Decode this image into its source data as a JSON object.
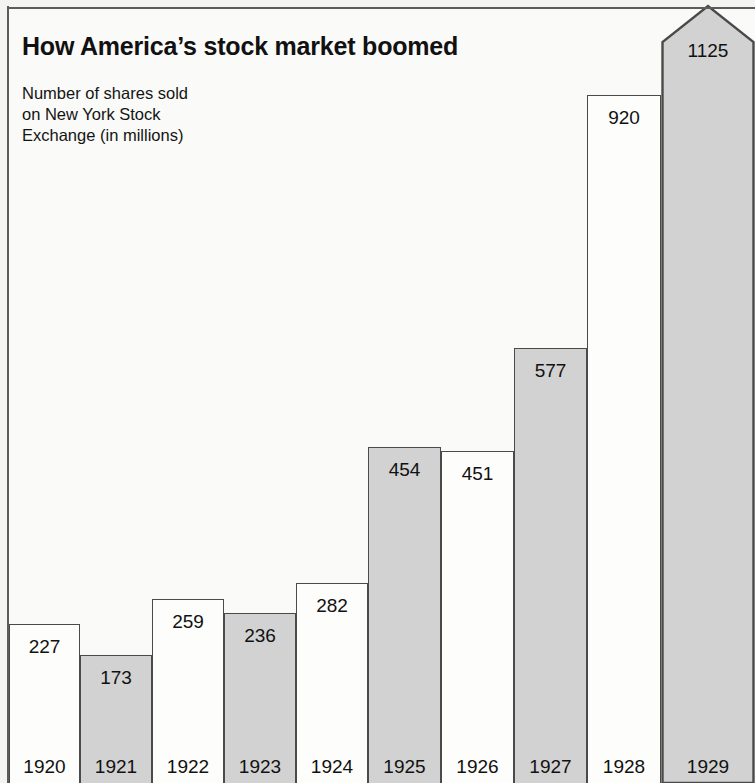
{
  "header": {
    "title": "How America’s stock market boomed",
    "subtitle": "Number of shares sold\non New York Stock\nExchange (in millions)"
  },
  "colors": {
    "bar_light": "#fdfdfb",
    "bar_dark": "#d2d2d2",
    "bar_outline": "#4a4a4a",
    "background": "#f4f4f2",
    "text": "#111111"
  },
  "chart_data": {
    "type": "bar",
    "title": "How America’s stock market boomed",
    "subtitle": "Number of shares sold on New York Stock Exchange (in millions)",
    "xlabel": "",
    "ylabel": "Number of shares sold (millions)",
    "ylim": [
      0,
      1125
    ],
    "grid": false,
    "legend": "none",
    "categories": [
      "1920",
      "1921",
      "1922",
      "1923",
      "1924",
      "1925",
      "1926",
      "1927",
      "1928",
      "1929"
    ],
    "values": [
      227,
      173,
      259,
      236,
      282,
      454,
      451,
      577,
      920,
      1125
    ],
    "bars": [
      {
        "year": "1920",
        "value": 227,
        "label": "227",
        "shade": "light",
        "top": 624,
        "left": 9,
        "width": 71
      },
      {
        "year": "1921",
        "value": 173,
        "label": "173",
        "shade": "dark",
        "top": 655,
        "left": 80,
        "width": 72
      },
      {
        "year": "1922",
        "value": 259,
        "label": "259",
        "shade": "light",
        "top": 599,
        "left": 152,
        "width": 72
      },
      {
        "year": "1923",
        "value": 236,
        "label": "236",
        "shade": "dark",
        "top": 613,
        "left": 224,
        "width": 72
      },
      {
        "year": "1924",
        "value": 282,
        "label": "282",
        "shade": "light",
        "top": 583,
        "left": 296,
        "width": 72
      },
      {
        "year": "1925",
        "value": 454,
        "label": "454",
        "shade": "dark",
        "top": 447,
        "left": 368,
        "width": 73
      },
      {
        "year": "1926",
        "value": 451,
        "label": "451",
        "shade": "light",
        "top": 451,
        "left": 441,
        "width": 73
      },
      {
        "year": "1927",
        "value": 577,
        "label": "577",
        "shade": "dark",
        "top": 348,
        "left": 514,
        "width": 73
      },
      {
        "year": "1928",
        "value": 920,
        "label": "920",
        "shade": "light",
        "top": 95,
        "left": 587,
        "width": 74
      },
      {
        "year": "1929",
        "value": 1125,
        "label": "1125",
        "shade": "dark",
        "top": 4,
        "left": 661,
        "width": 94,
        "pointed": true
      }
    ]
  }
}
